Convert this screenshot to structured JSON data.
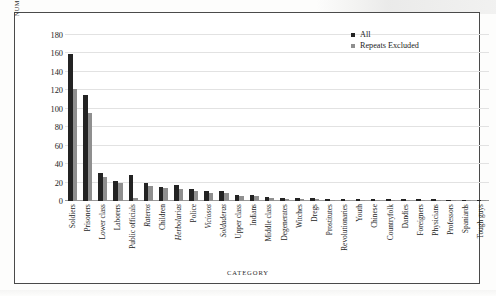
{
  "chart_data": {
    "type": "bar",
    "title": "",
    "xlabel": "CATEGORY",
    "ylabel": "NUMBER OF REFERENCES",
    "ylim": [
      0,
      180
    ],
    "yticks": [
      0,
      20,
      40,
      60,
      80,
      100,
      120,
      140,
      160,
      180
    ],
    "grid": true,
    "legend_position": "top-right",
    "categories": [
      "Soldiers",
      "Prisoners",
      "Lower class",
      "Laborers",
      "Public officials",
      "Rateros",
      "Children",
      "Herbolarias",
      "Police",
      "Viciosos",
      "Soldaderas",
      "Upper class",
      "Indians",
      "Middle class",
      "Degenerates",
      "Witches",
      "Dregs",
      "Prostitutes",
      "Revolutionaries",
      "Youth",
      "Chinese",
      "Countryfolk",
      "Dandies",
      "Foreigners",
      "Physicians",
      "Professors",
      "Spaniards",
      "Tough guys"
    ],
    "categories_italic": [
      false,
      false,
      false,
      false,
      false,
      true,
      false,
      true,
      false,
      true,
      true,
      false,
      false,
      false,
      false,
      false,
      false,
      false,
      false,
      false,
      false,
      false,
      false,
      false,
      false,
      false,
      false,
      false
    ],
    "series": [
      {
        "name": "All",
        "color": "#232323",
        "values": [
          159,
          115,
          30,
          22,
          28,
          19,
          15,
          17,
          13,
          11,
          11,
          7,
          7,
          4,
          3,
          3,
          3,
          2,
          2,
          2,
          2,
          2,
          2,
          2,
          2,
          1,
          1,
          1
        ]
      },
      {
        "name": "Repeats Excluded",
        "color": "#8f8f8f",
        "values": [
          121,
          95,
          26,
          19,
          3,
          16,
          14,
          13,
          11,
          9,
          9,
          5,
          5,
          3,
          2,
          2,
          2,
          1,
          1,
          1,
          1,
          1,
          1,
          1,
          1,
          1,
          1,
          1
        ]
      }
    ]
  },
  "legend": {
    "items": [
      {
        "label": "All"
      },
      {
        "label": "Repeats Excluded"
      }
    ]
  }
}
